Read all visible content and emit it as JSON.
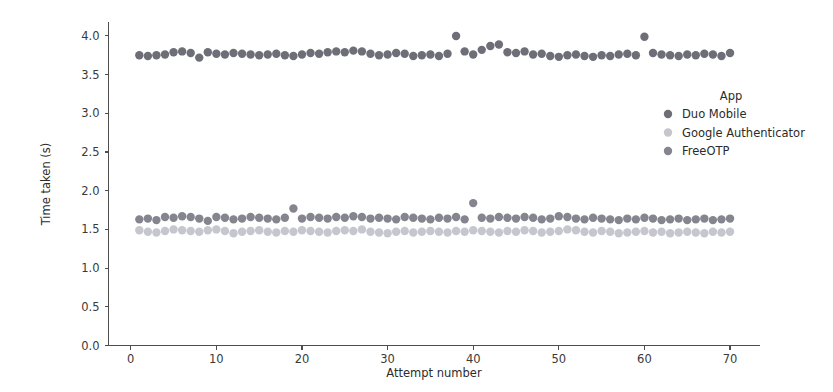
{
  "chart_data": {
    "type": "scatter",
    "title": "",
    "xlabel": "Attempt number",
    "ylabel": "Time taken (s)",
    "xlim": [
      -2.6,
      73.5
    ],
    "ylim": [
      0.0,
      4.18
    ],
    "xticks": [
      0,
      10,
      20,
      30,
      40,
      50,
      60,
      70
    ],
    "yticks": [
      0.0,
      0.5,
      1.0,
      1.5,
      2.0,
      2.5,
      3.0,
      3.5,
      4.0
    ],
    "xtick_labels": [
      "0",
      "10",
      "20",
      "30",
      "40",
      "50",
      "60",
      "70"
    ],
    "ytick_labels": [
      "0.0",
      "0.5",
      "1.0",
      "1.5",
      "2.0",
      "2.5",
      "3.0",
      "3.5",
      "4.0"
    ],
    "grid": false,
    "legend_position": "right-inside",
    "legend_title": "App",
    "marker": "circle",
    "marker_size": 4.2,
    "series": [
      {
        "name": "Duo Mobile",
        "color": "#6e6e78",
        "x": [
          1,
          2,
          3,
          4,
          5,
          6,
          7,
          8,
          9,
          10,
          11,
          12,
          13,
          14,
          15,
          16,
          17,
          18,
          19,
          20,
          21,
          22,
          23,
          24,
          25,
          26,
          27,
          28,
          29,
          30,
          31,
          32,
          33,
          34,
          35,
          36,
          37,
          38,
          39,
          40,
          41,
          42,
          43,
          44,
          45,
          46,
          47,
          48,
          49,
          50,
          51,
          52,
          53,
          54,
          55,
          56,
          57,
          58,
          59,
          60,
          61,
          62,
          63,
          64,
          65,
          66,
          67,
          68,
          69,
          70
        ],
        "values": [
          3.75,
          3.74,
          3.75,
          3.76,
          3.79,
          3.8,
          3.78,
          3.72,
          3.79,
          3.77,
          3.76,
          3.78,
          3.77,
          3.76,
          3.75,
          3.76,
          3.77,
          3.75,
          3.74,
          3.76,
          3.78,
          3.77,
          3.79,
          3.8,
          3.79,
          3.81,
          3.8,
          3.77,
          3.75,
          3.76,
          3.78,
          3.77,
          3.74,
          3.75,
          3.76,
          3.74,
          3.77,
          4.0,
          3.8,
          3.76,
          3.82,
          3.87,
          3.89,
          3.79,
          3.78,
          3.8,
          3.76,
          3.77,
          3.74,
          3.73,
          3.75,
          3.76,
          3.74,
          3.73,
          3.75,
          3.74,
          3.76,
          3.77,
          3.75,
          3.99,
          3.78,
          3.76,
          3.75,
          3.74,
          3.76,
          3.75,
          3.77,
          3.76,
          3.74,
          3.78
        ]
      },
      {
        "name": "Google Authenticator",
        "color": "#c6c6ce",
        "x": [
          1,
          2,
          3,
          4,
          5,
          6,
          7,
          8,
          9,
          10,
          11,
          12,
          13,
          14,
          15,
          16,
          17,
          18,
          19,
          20,
          21,
          22,
          23,
          24,
          25,
          26,
          27,
          28,
          29,
          30,
          31,
          32,
          33,
          34,
          35,
          36,
          37,
          38,
          39,
          40,
          41,
          42,
          43,
          44,
          45,
          46,
          47,
          48,
          49,
          50,
          51,
          52,
          53,
          54,
          55,
          56,
          57,
          58,
          59,
          60,
          61,
          62,
          63,
          64,
          65,
          66,
          67,
          68,
          69,
          70
        ],
        "values": [
          1.49,
          1.47,
          1.46,
          1.48,
          1.5,
          1.49,
          1.48,
          1.47,
          1.49,
          1.5,
          1.48,
          1.45,
          1.47,
          1.48,
          1.49,
          1.47,
          1.46,
          1.48,
          1.47,
          1.49,
          1.48,
          1.47,
          1.46,
          1.48,
          1.49,
          1.48,
          1.5,
          1.47,
          1.46,
          1.45,
          1.47,
          1.48,
          1.46,
          1.47,
          1.48,
          1.47,
          1.46,
          1.48,
          1.47,
          1.49,
          1.48,
          1.47,
          1.46,
          1.48,
          1.47,
          1.49,
          1.48,
          1.46,
          1.47,
          1.48,
          1.5,
          1.49,
          1.47,
          1.46,
          1.48,
          1.47,
          1.45,
          1.46,
          1.47,
          1.48,
          1.46,
          1.47,
          1.45,
          1.46,
          1.47,
          1.46,
          1.45,
          1.47,
          1.46,
          1.47
        ]
      },
      {
        "name": "FreeOTP",
        "color": "#85858f",
        "x": [
          1,
          2,
          3,
          4,
          5,
          6,
          7,
          8,
          9,
          10,
          11,
          12,
          13,
          14,
          15,
          16,
          17,
          18,
          19,
          20,
          21,
          22,
          23,
          24,
          25,
          26,
          27,
          28,
          29,
          30,
          31,
          32,
          33,
          34,
          35,
          36,
          37,
          38,
          39,
          40,
          41,
          42,
          43,
          44,
          45,
          46,
          47,
          48,
          49,
          50,
          51,
          52,
          53,
          54,
          55,
          56,
          57,
          58,
          59,
          60,
          61,
          62,
          63,
          64,
          65,
          66,
          67,
          68,
          69,
          70
        ],
        "values": [
          1.63,
          1.64,
          1.62,
          1.66,
          1.65,
          1.67,
          1.66,
          1.64,
          1.61,
          1.66,
          1.65,
          1.63,
          1.64,
          1.66,
          1.65,
          1.64,
          1.63,
          1.65,
          1.77,
          1.64,
          1.66,
          1.65,
          1.64,
          1.66,
          1.65,
          1.67,
          1.66,
          1.64,
          1.65,
          1.64,
          1.63,
          1.66,
          1.65,
          1.64,
          1.63,
          1.65,
          1.64,
          1.66,
          1.63,
          1.84,
          1.65,
          1.64,
          1.66,
          1.65,
          1.64,
          1.66,
          1.65,
          1.63,
          1.64,
          1.67,
          1.66,
          1.64,
          1.63,
          1.65,
          1.64,
          1.63,
          1.62,
          1.64,
          1.63,
          1.65,
          1.64,
          1.62,
          1.63,
          1.64,
          1.62,
          1.63,
          1.64,
          1.62,
          1.63,
          1.64
        ]
      }
    ]
  },
  "legend": {
    "title": "App",
    "entries": [
      {
        "label": "Duo Mobile",
        "color": "#6e6e78"
      },
      {
        "label": "Google Authenticator",
        "color": "#c6c6ce"
      },
      {
        "label": "FreeOTP",
        "color": "#85858f"
      }
    ]
  },
  "axes": {
    "xlabel": "Attempt number",
    "ylabel": "Time taken (s)"
  }
}
